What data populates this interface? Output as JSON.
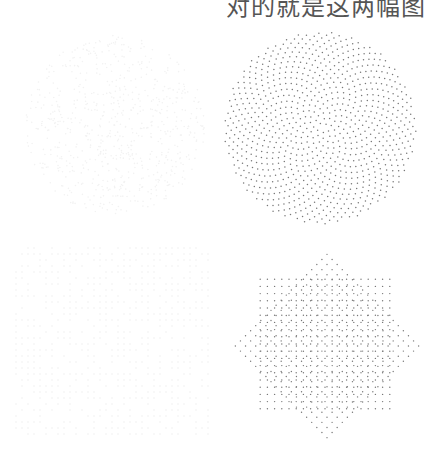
{
  "caption": {
    "text": "对的就是这两幅图",
    "clipped": "top"
  },
  "figures": [
    {
      "id": "top-left",
      "description": "very faint dot pattern (near white)",
      "pattern": "faint-scatter",
      "color": "#f2f2f2"
    },
    {
      "id": "top-right",
      "description": "Fibonacci sunflower spiral dot pattern in circular disc",
      "pattern": "phyllotaxis",
      "points": 900,
      "color": "#777777"
    },
    {
      "id": "bottom-left",
      "description": "very faint grid dot pattern (near white)",
      "pattern": "faint-grid",
      "color": "#f0f0f0"
    },
    {
      "id": "bottom-right",
      "description": "eight-pointed star lattice of dots (quasicrystal overlay of square and rotated square)",
      "pattern": "octagram-lattice",
      "color": "#777777"
    }
  ]
}
